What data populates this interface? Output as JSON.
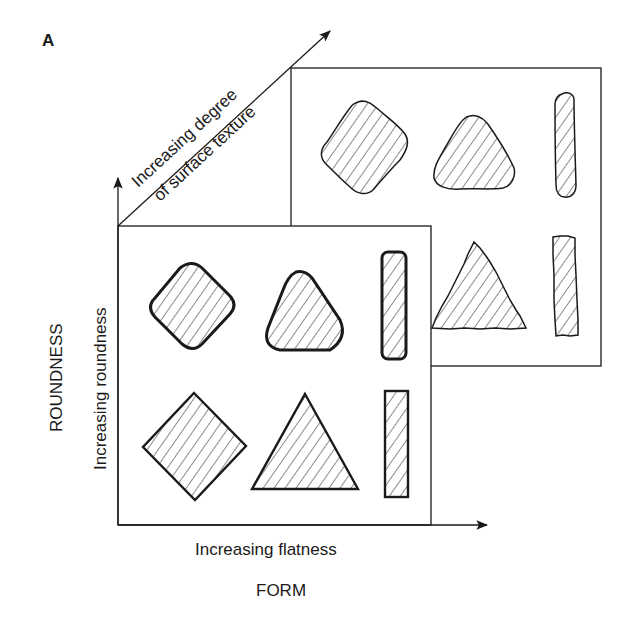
{
  "figure": {
    "panel_label": "A",
    "axes": {
      "vertical": {
        "title": "ROUNDNESS",
        "label": "Increasing roundness"
      },
      "horizontal": {
        "title": "FORM",
        "label": "Increasing flatness"
      },
      "diagonal": {
        "label_line1": "Increasing degree",
        "label_line2": "of surface texture"
      }
    },
    "panels": [
      {
        "name": "smooth-surface-panel",
        "rows": [
          {
            "roundness": "rounded",
            "shapes": [
              "rounded-square",
              "rounded-triangle",
              "rounded-bar"
            ]
          },
          {
            "roundness": "angular",
            "shapes": [
              "square",
              "triangle",
              "bar"
            ]
          }
        ]
      },
      {
        "name": "textured-surface-panel",
        "rows": [
          {
            "roundness": "rounded",
            "shapes": [
              "rough-rounded-square",
              "rough-rounded-triangle",
              "rough-rounded-bar"
            ]
          },
          {
            "roundness": "angular",
            "shapes": [
              "rough-triangle",
              "rough-bar"
            ]
          }
        ]
      }
    ],
    "colors": {
      "ink": "#1a1a1a",
      "background": "#ffffff"
    }
  }
}
